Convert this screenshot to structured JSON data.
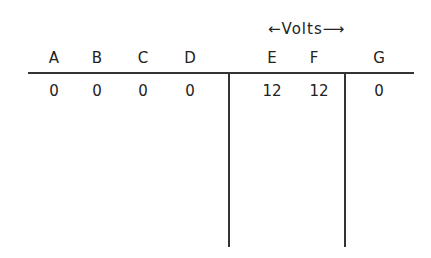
{
  "header": {
    "label": "Volts",
    "left_arrow": "←",
    "right_arrow": "⟶"
  },
  "columns": [
    {
      "name": "A",
      "value": "0"
    },
    {
      "name": "B",
      "value": "0"
    },
    {
      "name": "C",
      "value": "0"
    },
    {
      "name": "D",
      "value": "0"
    },
    {
      "name": "E",
      "value": "12"
    },
    {
      "name": "F",
      "value": "12"
    },
    {
      "name": "G",
      "value": "0"
    }
  ]
}
